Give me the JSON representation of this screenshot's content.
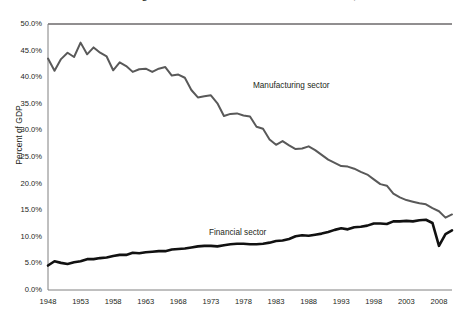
{
  "chart_data": {
    "type": "line",
    "title": "Manufacturing and financial sector shares of U.S. GDP, 1948–2010",
    "xlabel": "",
    "ylabel": "Percent of GDP",
    "xlim": [
      1948,
      2010
    ],
    "ylim": [
      0,
      50
    ],
    "ytick_labels": [
      "50.0%",
      "45.0%",
      "40.0%",
      "35.0%",
      "30.0%",
      "25.0%",
      "20.0%",
      "15.0%",
      "10.0%",
      "5.0%",
      "0.0%"
    ],
    "ytick_values": [
      50,
      45,
      40,
      35,
      30,
      25,
      20,
      15,
      10,
      5,
      0
    ],
    "xtick_labels": [
      "1948",
      "1953",
      "1958",
      "1963",
      "1968",
      "1973",
      "1978",
      "1983",
      "1988",
      "1993",
      "1998",
      "2003",
      "2008"
    ],
    "xtick_values": [
      1948,
      1953,
      1958,
      1963,
      1968,
      1973,
      1978,
      1983,
      1988,
      1993,
      1998,
      2003,
      2008
    ],
    "grid": false,
    "legend_position": "inline-annotations",
    "x": [
      1948,
      1949,
      1950,
      1951,
      1952,
      1953,
      1954,
      1955,
      1956,
      1957,
      1958,
      1959,
      1960,
      1961,
      1962,
      1963,
      1964,
      1965,
      1966,
      1967,
      1968,
      1969,
      1970,
      1971,
      1972,
      1973,
      1974,
      1975,
      1976,
      1977,
      1978,
      1979,
      1980,
      1981,
      1982,
      1983,
      1984,
      1985,
      1986,
      1987,
      1988,
      1989,
      1990,
      1991,
      1992,
      1993,
      1994,
      1995,
      1996,
      1997,
      1998,
      1999,
      2000,
      2001,
      2002,
      2003,
      2004,
      2005,
      2006,
      2007,
      2008,
      2009,
      2010
    ],
    "series": [
      {
        "name": "Manufacturing sector",
        "color": "#595959",
        "line_width": 2.0,
        "annotation": "Manufacturing sector",
        "values": [
          43.5,
          41.2,
          43.4,
          44.6,
          43.8,
          46.5,
          44.3,
          45.6,
          44.6,
          43.9,
          41.3,
          42.8,
          42.1,
          41.0,
          41.5,
          41.6,
          41.0,
          41.6,
          41.9,
          40.3,
          40.5,
          39.9,
          37.6,
          36.2,
          36.4,
          36.6,
          35.1,
          32.7,
          33.1,
          33.2,
          32.8,
          32.6,
          30.7,
          30.3,
          28.3,
          27.3,
          28.0,
          27.2,
          26.5,
          26.6,
          27.0,
          26.3,
          25.4,
          24.5,
          23.9,
          23.3,
          23.2,
          22.8,
          22.2,
          21.7,
          20.8,
          19.9,
          19.6,
          18.1,
          17.4,
          16.9,
          16.6,
          16.3,
          16.1,
          15.4,
          14.8,
          13.6,
          14.2
        ]
      },
      {
        "name": "Financial sector",
        "color": "#111111",
        "line_width": 2.6,
        "annotation": "Financial sector",
        "values": [
          4.6,
          5.4,
          5.1,
          4.9,
          5.2,
          5.4,
          5.8,
          5.8,
          6.0,
          6.1,
          6.4,
          6.6,
          6.6,
          7.0,
          6.9,
          7.1,
          7.2,
          7.3,
          7.3,
          7.6,
          7.7,
          7.8,
          8.0,
          8.2,
          8.3,
          8.3,
          8.2,
          8.4,
          8.6,
          8.7,
          8.7,
          8.6,
          8.6,
          8.7,
          8.9,
          9.2,
          9.3,
          9.6,
          10.1,
          10.3,
          10.2,
          10.4,
          10.6,
          10.9,
          11.3,
          11.6,
          11.4,
          11.8,
          11.9,
          12.1,
          12.5,
          12.5,
          12.4,
          12.9,
          12.9,
          13.0,
          12.9,
          13.1,
          13.2,
          12.6,
          8.3,
          10.5,
          11.2
        ]
      }
    ]
  }
}
